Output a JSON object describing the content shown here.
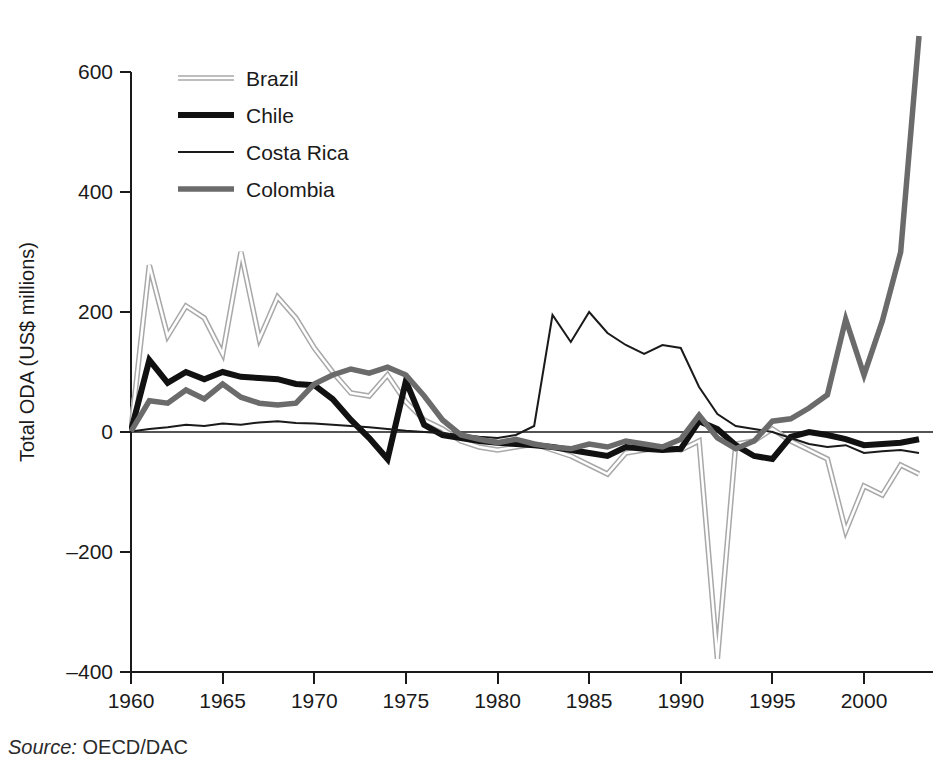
{
  "figure": {
    "source_prefix": "Source:",
    "source_value": "OECD/DAC"
  },
  "chart_data": {
    "type": "line",
    "title": "",
    "xlabel": "",
    "ylabel": "Total ODA (US$ millions)",
    "xlim": [
      1960,
      2003
    ],
    "ylim": [
      -400,
      600
    ],
    "yticks": [
      600,
      400,
      200,
      0,
      -200,
      -400
    ],
    "ytick_labels": [
      "600",
      "400",
      "200",
      "0",
      "–200",
      "–400"
    ],
    "xticks": [
      1960,
      1965,
      1970,
      1975,
      1980,
      1985,
      1990,
      1995,
      2000
    ],
    "xtick_labels": [
      "1960",
      "1965",
      "1970",
      "1975",
      "1980",
      "1985",
      "1990",
      "1995",
      "2000"
    ],
    "grid": false,
    "legend_position": "top-left",
    "x": [
      1960,
      1961,
      1962,
      1963,
      1964,
      1965,
      1966,
      1967,
      1968,
      1969,
      1970,
      1971,
      1972,
      1973,
      1974,
      1975,
      1976,
      1977,
      1978,
      1979,
      1980,
      1981,
      1982,
      1983,
      1984,
      1985,
      1986,
      1987,
      1988,
      1989,
      1990,
      1991,
      1992,
      1993,
      1994,
      1995,
      1996,
      1997,
      1998,
      1999,
      2000,
      2001,
      2002,
      2003
    ],
    "series": [
      {
        "name": "Brazil",
        "color": "#a8a8a8",
        "stroke_width": 5.5,
        "style": "outlined-light",
        "values": [
          3,
          278,
          160,
          210,
          190,
          130,
          300,
          155,
          225,
          190,
          140,
          100,
          65,
          60,
          95,
          50,
          20,
          5,
          -15,
          -25,
          -30,
          -25,
          -20,
          -30,
          -40,
          -55,
          -70,
          -35,
          -30,
          -25,
          -30,
          -15,
          -378,
          -20,
          -15,
          5,
          -15,
          -30,
          -45,
          -165,
          -90,
          -105,
          -55,
          -70
        ]
      },
      {
        "name": "Chile",
        "color": "#111111",
        "stroke_width": 6.0,
        "style": "solid-thick",
        "values": [
          2,
          120,
          82,
          100,
          88,
          100,
          92,
          90,
          88,
          80,
          78,
          55,
          20,
          -10,
          -45,
          85,
          12,
          -5,
          -10,
          -15,
          -18,
          -20,
          -22,
          -25,
          -30,
          -35,
          -40,
          -25,
          -28,
          -30,
          -28,
          18,
          5,
          -22,
          -40,
          -45,
          -8,
          0,
          -5,
          -12,
          -22,
          -20,
          -18,
          -12
        ]
      },
      {
        "name": "Costa Rica",
        "color": "#1a1a1a",
        "stroke_width": 2.0,
        "style": "solid-thin",
        "values": [
          1,
          5,
          8,
          12,
          10,
          14,
          12,
          16,
          18,
          15,
          14,
          12,
          10,
          8,
          5,
          2,
          0,
          -2,
          -5,
          -8,
          -10,
          -5,
          10,
          195,
          150,
          200,
          165,
          145,
          130,
          145,
          140,
          75,
          30,
          10,
          5,
          0,
          -10,
          -20,
          -25,
          -22,
          -35,
          -32,
          -30,
          -35
        ]
      },
      {
        "name": "Colombia",
        "color": "#6b6b6b",
        "stroke_width": 5.5,
        "style": "solid-medium",
        "values": [
          1,
          52,
          48,
          70,
          55,
          80,
          58,
          48,
          45,
          48,
          80,
          95,
          105,
          98,
          108,
          95,
          60,
          20,
          -5,
          -12,
          -18,
          -12,
          -20,
          -25,
          -28,
          -20,
          -25,
          -15,
          -20,
          -25,
          -12,
          28,
          -10,
          -28,
          -15,
          18,
          22,
          40,
          62,
          188,
          95,
          185,
          300,
          660
        ]
      }
    ],
    "legend": [
      {
        "name": "Brazil"
      },
      {
        "name": "Chile"
      },
      {
        "name": "Costa Rica"
      },
      {
        "name": "Colombia"
      }
    ]
  }
}
